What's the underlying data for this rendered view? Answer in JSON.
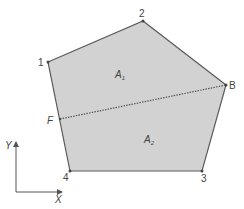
{
  "diagram": {
    "fill_color": "#d2d2d2",
    "edge_color": "#5a5a5a",
    "divider_color": "#555555",
    "vertices": {
      "v1": {
        "label": "1",
        "x": 48,
        "y": 62
      },
      "v2": {
        "label": "2",
        "x": 143,
        "y": 21
      },
      "vB": {
        "label": "B",
        "x": 226,
        "y": 85
      },
      "v3": {
        "label": "3",
        "x": 202,
        "y": 171
      },
      "v4": {
        "label": "4",
        "x": 70,
        "y": 171
      },
      "vF": {
        "label": "F",
        "x": 60,
        "y": 119
      }
    },
    "regions": {
      "A1": {
        "label": "A",
        "subscript": "1"
      },
      "A2": {
        "label": "A",
        "subscript": "2"
      }
    },
    "axes": {
      "x_label": "X",
      "y_label": "Y"
    }
  }
}
